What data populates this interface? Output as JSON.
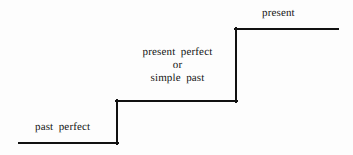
{
  "diagram": {
    "background_color": "#fdfdfd",
    "stroke_color": "#111111",
    "stroke_width": 2,
    "steps": [
      {
        "id": "past-perfect",
        "level": 1,
        "label": "past perfect",
        "tread": {
          "x1": 19,
          "x2": 118,
          "y": 143
        }
      },
      {
        "id": "present-perfect-or-simple-past",
        "level": 2,
        "label_lines": [
          "present  perfect",
          "or",
          "simple  past"
        ],
        "tread": {
          "x1": 117,
          "x2": 237,
          "y": 101
        }
      },
      {
        "id": "present",
        "level": 3,
        "label": "present",
        "tread": {
          "x1": 236,
          "x2": 338,
          "y": 29
        }
      }
    ],
    "risers": [
      {
        "id": "riser-past-to-present-perfect",
        "x": 117,
        "y1": 144,
        "y2": 100
      },
      {
        "id": "riser-present-perfect-to-present",
        "x": 236,
        "y1": 102,
        "y2": 28
      }
    ],
    "labels": {
      "past_perfect": "past  perfect",
      "middle_line_1": "present  perfect",
      "middle_line_2": "or",
      "middle_line_3": "simple  past",
      "present": "present"
    }
  }
}
